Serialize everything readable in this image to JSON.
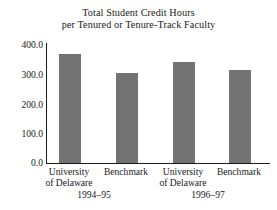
{
  "chart_data": {
    "type": "bar",
    "title": "Total Student Credit Hours per Tenured or Tenure-Track Faculty",
    "title_lines": [
      "Total Student Credit Hours",
      "per Tenured or Tenure-Track Faculty"
    ],
    "xlabel": "",
    "ylabel": "",
    "ylim": [
      0,
      400
    ],
    "yticks": [
      0,
      100,
      200,
      300,
      400
    ],
    "ytick_labels": [
      "0.0",
      "100.0",
      "200.0",
      "300.0",
      "400.0"
    ],
    "grid": false,
    "legend": "none",
    "bar_color": "#737373",
    "axis_color": "#1a1a1a",
    "background": "#ffffff",
    "categories": [
      "University of Delaware",
      "Benchmark",
      "University of Delaware",
      "Benchmark"
    ],
    "category_lines": [
      [
        "University",
        "of Delaware"
      ],
      [
        "Benchmark"
      ],
      [
        "University",
        "of Delaware"
      ],
      [
        "Benchmark"
      ]
    ],
    "values": [
      365,
      300,
      337,
      310
    ],
    "groups": [
      {
        "label": "1994–95",
        "categories": [
          "University of Delaware",
          "Benchmark"
        ],
        "values": [
          365,
          300
        ]
      },
      {
        "label": "1996–97",
        "categories": [
          "University of Delaware",
          "Benchmark"
        ],
        "values": [
          337,
          310
        ]
      }
    ],
    "group_labels": [
      "1994–95",
      "1996–97"
    ]
  }
}
